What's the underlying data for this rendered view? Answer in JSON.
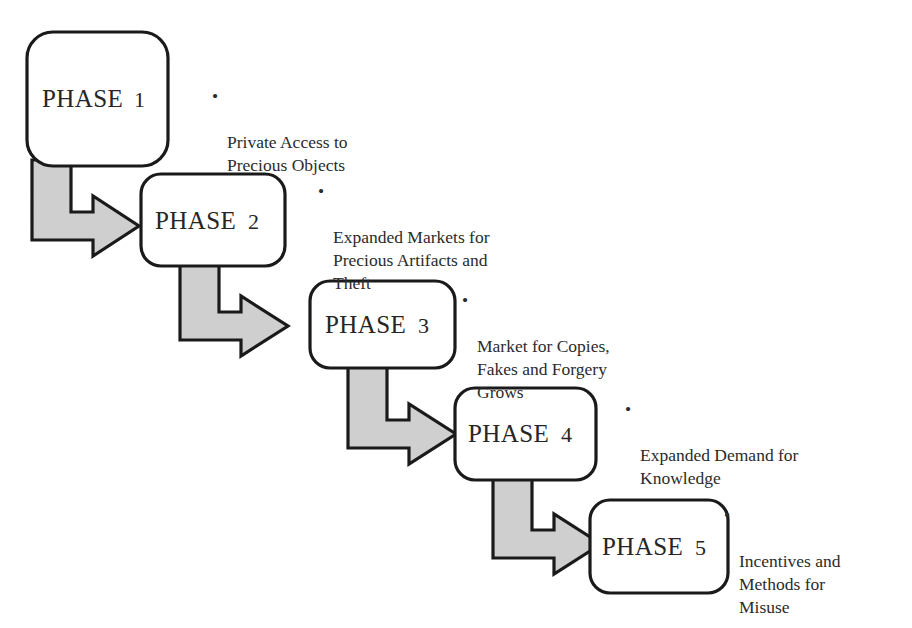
{
  "diagram": {
    "type": "staircase-flow",
    "title": "",
    "background_color": "#ffffff",
    "box_fill": "#ffffff",
    "box_stroke": "#1a1a1a",
    "arrow_fill": "#cfcfcf",
    "arrow_stroke": "#1a1a1a",
    "text_color": "#2b2b2b",
    "bullet_glyph": "•",
    "phases": [
      {
        "id": "phase-1",
        "label": "PHASE",
        "number": "1",
        "box": {
          "x": 27,
          "y": 32,
          "w": 141,
          "h": 134,
          "r": 26
        },
        "bullet": {
          "x": 212,
          "y": 85,
          "text": "Private Access to\nPrecious Objects"
        }
      },
      {
        "id": "phase-2",
        "label": "PHASE",
        "number": "2",
        "box": {
          "x": 141,
          "y": 174,
          "w": 144,
          "h": 92,
          "r": 20
        },
        "bullet": {
          "x": 318,
          "y": 180,
          "text": "Expanded Markets for\nPrecious Artifacts and\nTheft"
        }
      },
      {
        "id": "phase-3",
        "label": "PHASE",
        "number": "3",
        "box": {
          "x": 310,
          "y": 281,
          "w": 145,
          "h": 87,
          "r": 20
        },
        "bullet": {
          "x": 462,
          "y": 289,
          "text": "Market for Copies,\nFakes and Forgery\nGrows"
        }
      },
      {
        "id": "phase-4",
        "label": "PHASE",
        "number": "4",
        "box": {
          "x": 455,
          "y": 388,
          "w": 141,
          "h": 92,
          "r": 20
        },
        "bullet": {
          "x": 625,
          "y": 398,
          "text": "Expanded Demand for\nKnowledge"
        }
      },
      {
        "id": "phase-5",
        "label": "PHASE",
        "number": "5",
        "box": {
          "x": 590,
          "y": 500,
          "w": 138,
          "h": 93,
          "r": 20
        },
        "bullet": {
          "x": 724,
          "y": 504,
          "text": "Incentives and\nMethods for\nMisuse"
        }
      }
    ],
    "connectors": [
      {
        "id": "arrow-phase-1-to-phase-2",
        "from": "phase-1",
        "to": "phase-2"
      },
      {
        "id": "arrow-phase-2-to-phase-3",
        "from": "phase-2",
        "to": "phase-3"
      },
      {
        "id": "arrow-phase-3-to-phase-4",
        "from": "phase-3",
        "to": "phase-4"
      },
      {
        "id": "arrow-phase-4-to-phase-5",
        "from": "phase-4",
        "to": "phase-5"
      }
    ]
  }
}
